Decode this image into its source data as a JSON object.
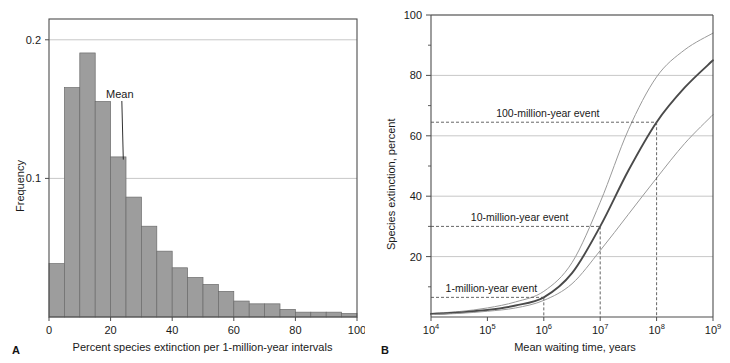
{
  "figure": {
    "panels": [
      {
        "letter": "A",
        "xlabel": "Percent species extinction per 1-million-year intervals",
        "ylabel": "Frequency",
        "annotation": "Mean"
      },
      {
        "letter": "B",
        "xlabel": "Mean waiting time, years",
        "ylabel": "Species extinction, percent",
        "annotations": [
          "100-million-year event",
          "10-million-year event",
          "1-million-year event"
        ]
      }
    ]
  },
  "colors": {
    "bar_fill": "#9d9d9d",
    "bar_stroke": "#6b6b6b",
    "axis": "#4d4d4d",
    "grid": "#b9b9b9",
    "curve_main": "#4a4a4a",
    "curve_bound": "#9a9a9a",
    "dashed": "#555555",
    "text": "#1a1a1a"
  },
  "chart_data": [
    {
      "type": "bar",
      "panel": "A",
      "title": "",
      "xlabel": "Percent species extinction per 1-million-year intervals",
      "ylabel": "Frequency",
      "xlim": [
        0,
        100
      ],
      "ylim": [
        0,
        0.215
      ],
      "xticks": [
        0,
        20,
        40,
        60,
        80,
        100
      ],
      "xticklabels": [
        "0",
        "20",
        "40",
        "60",
        "80",
        "100"
      ],
      "yticks": [
        0.1,
        0.2
      ],
      "yticklabels": [
        "0.1",
        "0.2"
      ],
      "grid": "horizontal",
      "bin_width": 5,
      "bin_starts": [
        0,
        5,
        10,
        15,
        20,
        25,
        30,
        35,
        40,
        45,
        50,
        55,
        60,
        65,
        70,
        75,
        80,
        85,
        90,
        95
      ],
      "values": [
        0.0385,
        0.1655,
        0.1905,
        0.1555,
        0.1155,
        0.0865,
        0.0655,
        0.0475,
        0.0355,
        0.0285,
        0.0235,
        0.0185,
        0.0115,
        0.0095,
        0.0095,
        0.0055,
        0.0035,
        0.0035,
        0.0035,
        0.0025
      ],
      "annotations": [
        {
          "text": "Mean",
          "x": 22.5,
          "y": 0.115,
          "label_x": 23,
          "label_y": 0.158
        }
      ]
    },
    {
      "type": "line",
      "panel": "B",
      "title": "",
      "xlabel": "Mean waiting time, years",
      "ylabel": "Species extinction, percent",
      "xscale": "log",
      "xlim": [
        10000,
        1000000000
      ],
      "ylim": [
        0,
        100
      ],
      "xticks": [
        10000,
        100000,
        1000000,
        10000000,
        100000000,
        1000000000
      ],
      "xticklabels": [
        "10^4",
        "10^5",
        "10^6",
        "10^7",
        "10^8",
        "10^9"
      ],
      "yticks": [
        20,
        40,
        60,
        80,
        100
      ],
      "yticklabels": [
        "20",
        "40",
        "60",
        "80",
        "100"
      ],
      "yminorticks": [
        10,
        30,
        50,
        70,
        90
      ],
      "grid": "horizontal",
      "series": [
        {
          "name": "upper bound",
          "x": [
            10000,
            31623,
            100000,
            316228,
            1000000,
            3162278,
            10000000,
            31622777,
            100000000,
            316227766,
            1000000000
          ],
          "values": [
            1.2,
            1.8,
            3.0,
            5.0,
            8.5,
            18.0,
            38.0,
            62.0,
            79.5,
            88.5,
            94.0
          ]
        },
        {
          "name": "best estimate",
          "x": [
            10000,
            31623,
            100000,
            316228,
            1000000,
            3162278,
            10000000,
            31622777,
            100000000,
            316227766,
            1000000000
          ],
          "values": [
            1.0,
            1.5,
            2.3,
            3.8,
            6.5,
            14.5,
            30.0,
            48.5,
            64.5,
            76.0,
            85.0
          ]
        },
        {
          "name": "lower bound",
          "x": [
            10000,
            31623,
            100000,
            316228,
            1000000,
            3162278,
            10000000,
            31622777,
            100000000,
            316227766,
            1000000000
          ],
          "values": [
            0.8,
            1.2,
            1.9,
            3.0,
            5.5,
            11.0,
            22.0,
            34.0,
            46.0,
            57.5,
            67.0
          ]
        }
      ],
      "markers": [
        {
          "label": "1-million-year event",
          "x": 1000000,
          "y": 6.5
        },
        {
          "label": "10-million-year event",
          "x": 10000000,
          "y": 30.0
        },
        {
          "label": "100-million-year event",
          "x": 100000000,
          "y": 64.5
        }
      ]
    }
  ]
}
